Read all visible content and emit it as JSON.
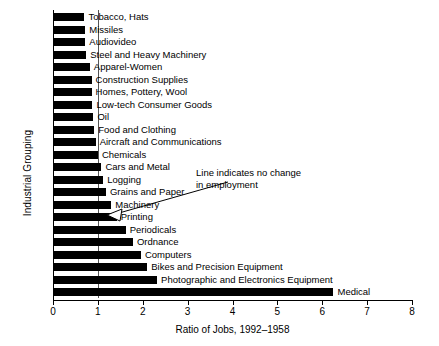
{
  "chart_data": {
    "type": "bar",
    "orientation": "horizontal",
    "title": "",
    "xlabel": "Ratio  of Jobs, 1992–1958",
    "ylabel": "Industrial Grouping",
    "xlim": [
      0,
      8
    ],
    "xticks": [
      0,
      1,
      2,
      3,
      4,
      5,
      6,
      7,
      8
    ],
    "xtick_labels": [
      "0",
      "1",
      "2",
      "3",
      "4",
      "5",
      "6",
      "7",
      "8"
    ],
    "grid": false,
    "legend": "none",
    "reference_line": {
      "value": 1,
      "label": "Line indicates no change in employment"
    },
    "categories": [
      "Tobacco, Hats",
      "Missiles",
      "Audiovideo",
      "Steel and Heavy Machinery",
      "Apparel-Women",
      "Construction Supplies",
      "Homes, Pottery, Wool",
      "Low-tech Consumer Goods",
      "Oil",
      "Food and Clothing",
      "Aircraft and Communications",
      "Chemicals",
      "Cars and Metal",
      "Logging",
      "Grains and Paper",
      "Machinery",
      "Printing",
      "Periodicals",
      "Ordnance",
      "Computers",
      "Bikes and Precision Equipment",
      "Photographic and Electronics Equipment",
      "Medical"
    ],
    "values": [
      0.7,
      0.72,
      0.72,
      0.74,
      0.82,
      0.86,
      0.86,
      0.88,
      0.9,
      0.92,
      0.95,
      1.0,
      1.08,
      1.12,
      1.18,
      1.3,
      1.42,
      1.62,
      1.78,
      1.96,
      2.1,
      2.32,
      6.25
    ]
  },
  "annotation": {
    "line1": "Line indicates no change",
    "line2": "in employment"
  },
  "axis": {
    "x_title": "Ratio  of Jobs, 1992–1958",
    "y_title": "Industrial Grouping"
  },
  "colors": {
    "bar": "#000000",
    "background": "#ffffff",
    "axis": "#000000",
    "reference_line": "#555555"
  }
}
